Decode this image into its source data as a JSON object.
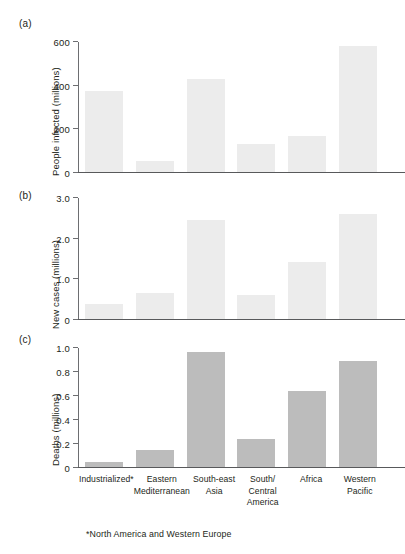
{
  "figure": {
    "footnote": "*North America and Western Europe",
    "bar_color_light": "#ececec",
    "bar_color_dark": "#bcbcbc",
    "axis_color": "#6d6e71",
    "text_color": "#231f20"
  },
  "categories": [
    "Industrialized*",
    "Eastern\nMediterranean",
    "South-east\nAsia",
    "South/\nCentral\nAmerica",
    "Africa",
    "Western\nPacific"
  ],
  "category_lines": [
    [
      "Industrialized*"
    ],
    [
      "Eastern",
      "Mediterranean"
    ],
    [
      "South-east",
      "Asia"
    ],
    [
      "South/",
      "Central",
      "America"
    ],
    [
      "Africa"
    ],
    [
      "Western",
      "Pacific"
    ]
  ],
  "panels": [
    {
      "letter": "(a)",
      "ylabel": "People infected (millions)",
      "ticks": [
        "0",
        "200",
        "400",
        "600"
      ],
      "tick_values": [
        0,
        200,
        400,
        600
      ],
      "ymax": 600,
      "values": [
        375,
        50,
        430,
        130,
        165,
        580
      ]
    },
    {
      "letter": "(b)",
      "ylabel": "New cases (millions)",
      "ticks": [
        "0",
        "1.0",
        "2.0",
        "3.0"
      ],
      "tick_values": [
        0,
        1.0,
        2.0,
        3.0
      ],
      "ymax": 3.0,
      "values": [
        0.38,
        0.65,
        2.45,
        0.6,
        1.42,
        2.6
      ]
    },
    {
      "letter": "(c)",
      "ylabel": "Deaths (millions)",
      "ticks": [
        "0",
        "0.2",
        "0.4",
        "0.6",
        "0.8",
        "1.0"
      ],
      "tick_values": [
        0,
        0.2,
        0.4,
        0.6,
        0.8,
        1.0
      ],
      "ymax": 1.0,
      "values": [
        0.04,
        0.14,
        0.97,
        0.235,
        0.635,
        0.89
      ]
    }
  ],
  "chart_data": {
    "type": "bar",
    "title": "",
    "xlabel": "",
    "categories": [
      "Industrialized*",
      "Eastern Mediterranean",
      "South-east Asia",
      "South/Central America",
      "Africa",
      "Western Pacific"
    ],
    "panels": [
      {
        "panel": "(a)",
        "ylabel": "People infected (millions)",
        "ylim": [
          0,
          600
        ],
        "yticks": [
          0,
          200,
          400,
          600
        ],
        "values": [
          375,
          50,
          430,
          130,
          165,
          580
        ],
        "grid": false
      },
      {
        "panel": "(b)",
        "ylabel": "New cases (millions)",
        "ylim": [
          0,
          3.0
        ],
        "yticks": [
          0,
          1.0,
          2.0,
          3.0
        ],
        "values": [
          0.38,
          0.65,
          2.45,
          0.6,
          1.42,
          2.6
        ],
        "grid": false
      },
      {
        "panel": "(c)",
        "ylabel": "Deaths (millions)",
        "ylim": [
          0,
          1.0
        ],
        "yticks": [
          0,
          0.2,
          0.4,
          0.6,
          0.8,
          1.0
        ],
        "values": [
          0.04,
          0.14,
          0.97,
          0.235,
          0.635,
          0.89
        ],
        "grid": false
      }
    ],
    "annotations": [
      "*North America and Western Europe"
    ],
    "legend": null
  }
}
